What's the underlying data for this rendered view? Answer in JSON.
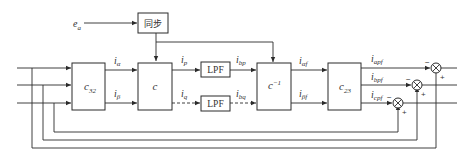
{
  "diagram": {
    "type": "block-diagram",
    "input_signal": "e_a",
    "blocks": {
      "sync": {
        "label": "同步"
      },
      "c32": {
        "label": "c",
        "sub": "32"
      },
      "c": {
        "label": "c"
      },
      "lpf_p": {
        "label": "LPF"
      },
      "lpf_q": {
        "label": "LPF"
      },
      "cinv": {
        "label": "c",
        "sup": "−1"
      },
      "c23": {
        "label": "c",
        "sub": "23"
      }
    },
    "signals": {
      "ea": {
        "main": "e",
        "sub": "a"
      },
      "ialpha": {
        "main": "i",
        "sub": "α"
      },
      "ibeta": {
        "main": "i",
        "sub": "β"
      },
      "ip": {
        "main": "i",
        "sub": "p"
      },
      "iq": {
        "main": "i",
        "sub": "q"
      },
      "ibp": {
        "main": "i",
        "sub": "bp"
      },
      "ibq": {
        "main": "i",
        "sub": "bq"
      },
      "ialphaf": {
        "main": "i",
        "sub": "αf"
      },
      "ibetaf": {
        "main": "i",
        "sub": "βf"
      },
      "iapf": {
        "main": "i",
        "sub": "apf"
      },
      "ibpf": {
        "main": "i",
        "sub": "bpf"
      },
      "icpf": {
        "main": "i",
        "sub": "cpf"
      }
    },
    "summing_junctions": [
      {
        "id": "sum-a",
        "minus": "−",
        "plus": "+"
      },
      {
        "id": "sum-b",
        "minus": "−",
        "plus": "+"
      },
      {
        "id": "sum-c",
        "minus": "−",
        "plus": "+"
      }
    ]
  }
}
